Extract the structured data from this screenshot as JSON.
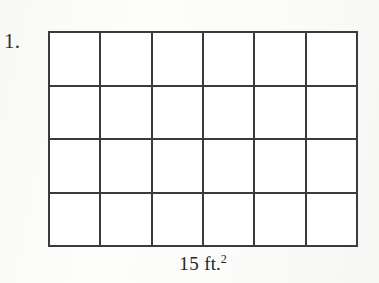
{
  "document": {
    "type": "math-worksheet-figure",
    "background_color": "#fdfdfb",
    "ink_color": "#3b3b3b"
  },
  "problem": {
    "number_label": "1."
  },
  "figure": {
    "kind": "area-grid",
    "columns": 6,
    "rows": 4,
    "total_cells": 24,
    "cell_fill": "empty",
    "border_color": "#3b3b3b",
    "caption": {
      "value": "15",
      "unit": "ft.",
      "exponent": "2",
      "full_text": "15 ft.²"
    }
  },
  "chart_data": {
    "type": "table",
    "columns": 6,
    "rows": 4,
    "values": [
      [
        "",
        "",
        "",
        "",
        "",
        ""
      ],
      [
        "",
        "",
        "",
        "",
        "",
        ""
      ],
      [
        "",
        "",
        "",
        "",
        "",
        ""
      ],
      [
        "",
        "",
        "",
        "",
        "",
        ""
      ]
    ]
  }
}
